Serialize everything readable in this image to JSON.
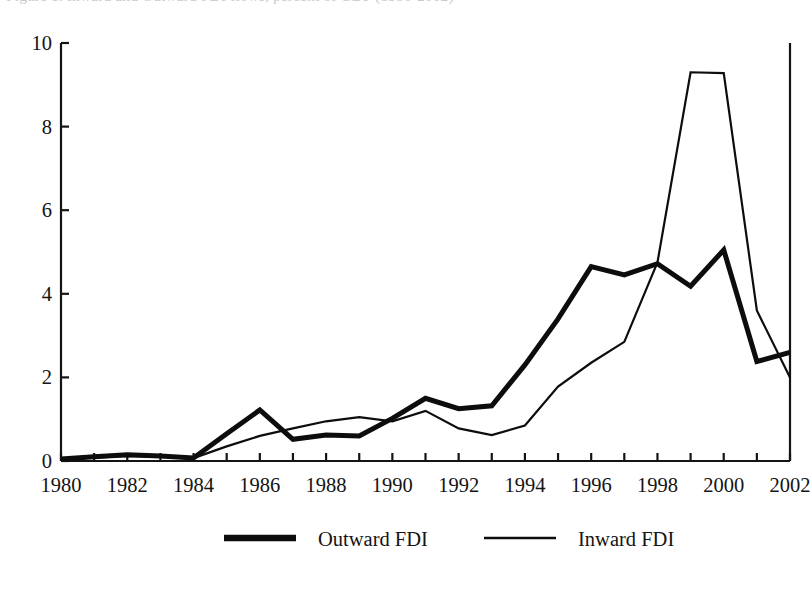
{
  "figure": {
    "caption_partial": "Figure 1.  Inward and Outward FDI flows, percent of GDP (1980-2002)",
    "axis_color": "#141414"
  },
  "chart_data": {
    "type": "line",
    "title": "",
    "subtitle": "",
    "xlabel": "",
    "ylabel": "",
    "xlim": [
      1980,
      2002
    ],
    "ylim": [
      0,
      10
    ],
    "yticks": [
      0,
      2,
      4,
      6,
      8,
      10
    ],
    "ytick_labels": [
      "0",
      "2",
      "4",
      "6",
      "8",
      "10"
    ],
    "xticks": [
      1980,
      1981,
      1982,
      1983,
      1984,
      1985,
      1986,
      1987,
      1988,
      1989,
      1990,
      1991,
      1992,
      1993,
      1994,
      1995,
      1996,
      1997,
      1998,
      1999,
      2000,
      2001,
      2002
    ],
    "xtick_labels_shown": [
      "1980",
      "1982",
      "1984",
      "1986",
      "1988",
      "1990",
      "1992",
      "1994",
      "1996",
      "1998",
      "2000",
      "2002"
    ],
    "xtick_label_interval": 2,
    "grid": false,
    "legend_position": "bottom-center",
    "x": [
      1980,
      1981,
      1982,
      1983,
      1984,
      1985,
      1986,
      1987,
      1988,
      1989,
      1990,
      1991,
      1992,
      1993,
      1994,
      1995,
      1996,
      1997,
      1998,
      1999,
      2000,
      2001,
      2002
    ],
    "series": [
      {
        "name": "Outward FDI",
        "line_style": "thick",
        "line_width_px": 5.0,
        "color": "#0d0d0d",
        "values": [
          0.05,
          0.1,
          0.15,
          0.12,
          0.07,
          0.65,
          1.22,
          0.52,
          0.62,
          0.6,
          1.02,
          1.5,
          1.25,
          1.32,
          2.3,
          3.4,
          4.65,
          4.45,
          4.72,
          4.18,
          5.05,
          2.38,
          2.6
        ]
      },
      {
        "name": "Inward FDI",
        "line_style": "thin",
        "line_width_px": 2.2,
        "color": "#0d0d0d",
        "values": [
          0.05,
          0.08,
          0.12,
          0.1,
          0.07,
          0.35,
          0.6,
          0.78,
          0.95,
          1.05,
          0.95,
          1.2,
          0.78,
          0.62,
          0.85,
          1.78,
          2.35,
          2.85,
          4.75,
          9.3,
          9.28,
          3.6,
          2.0
        ]
      }
    ],
    "legend": [
      {
        "label": "Outward FDI",
        "marker": "thick-line"
      },
      {
        "label": "Inward FDI",
        "marker": "thin-line"
      }
    ]
  }
}
